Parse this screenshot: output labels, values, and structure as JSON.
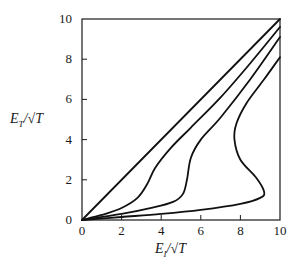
{
  "chart_data": {
    "type": "line",
    "title": "",
    "xlabel": "E_I/√T",
    "ylabel": "E_T/√T",
    "xlim": [
      0,
      10
    ],
    "ylim": [
      0,
      10
    ],
    "x_ticks": [
      "0",
      "2",
      "4",
      "6",
      "8",
      "10"
    ],
    "y_ticks": [
      "0",
      "2",
      "4",
      "6",
      "8",
      "10"
    ],
    "grid": false,
    "legend": null,
    "series": [
      {
        "name": "curve-1",
        "points": [
          [
            0,
            0
          ],
          [
            10,
            10
          ]
        ]
      },
      {
        "name": "curve-2",
        "points": [
          [
            0,
            0
          ],
          [
            1,
            0.25
          ],
          [
            2,
            0.6
          ],
          [
            2.8,
            1.1
          ],
          [
            3.3,
            1.8
          ],
          [
            3.7,
            2.6
          ],
          [
            4.5,
            3.6
          ],
          [
            5.5,
            4.6
          ],
          [
            7,
            6.1
          ],
          [
            8.5,
            7.8
          ],
          [
            10,
            9.6
          ]
        ]
      },
      {
        "name": "curve-3",
        "points": [
          [
            0,
            0
          ],
          [
            2,
            0.3
          ],
          [
            3.5,
            0.6
          ],
          [
            4.6,
            0.9
          ],
          [
            5.1,
            1.3
          ],
          [
            5.3,
            2
          ],
          [
            5.5,
            3.1
          ],
          [
            6,
            4
          ],
          [
            7,
            5.1
          ],
          [
            8.5,
            7
          ],
          [
            10,
            9.1
          ]
        ]
      },
      {
        "name": "curve-4",
        "points": [
          [
            0,
            0
          ],
          [
            2,
            0.15
          ],
          [
            4,
            0.3
          ],
          [
            6,
            0.5
          ],
          [
            8,
            0.8
          ],
          [
            9,
            1.1
          ],
          [
            9.2,
            1.4
          ],
          [
            8.8,
            2.1
          ],
          [
            8,
            3.0
          ],
          [
            7.7,
            4.0
          ],
          [
            7.8,
            4.8
          ],
          [
            8.3,
            5.8
          ],
          [
            9.2,
            7.0
          ],
          [
            10,
            8.1
          ]
        ]
      }
    ]
  },
  "axes": {
    "x_title_main": "E",
    "x_title_sub": "I",
    "x_title_tail": "/√T",
    "y_title_main": "E",
    "y_title_sub": "T",
    "y_title_tail": "/√T"
  }
}
